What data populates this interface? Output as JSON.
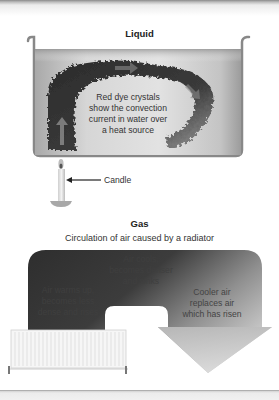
{
  "liquid": {
    "title": "Liquid",
    "dye_label": [
      "Red dye crystals",
      "show the convection",
      "current in water over",
      "a heat source"
    ],
    "candle_label": "Candle"
  },
  "gas": {
    "title": "Gas",
    "subtitle": "Circulation of air caused by a radiator",
    "warm_label": [
      "Air warms up,",
      "becomes less",
      "dense and rises"
    ],
    "cool_label": [
      "Air cools,",
      "becomes denser",
      "and sinks"
    ],
    "replace_label": [
      "Cooler air",
      "replaces air",
      "which has risen"
    ]
  },
  "colors": {
    "water_fill": "#c8c8c8",
    "dye": "#2e2e2e",
    "air_dark": "#3a3a3a",
    "air_light": "#cfcfcf",
    "radiator": "#f4f4f4"
  }
}
